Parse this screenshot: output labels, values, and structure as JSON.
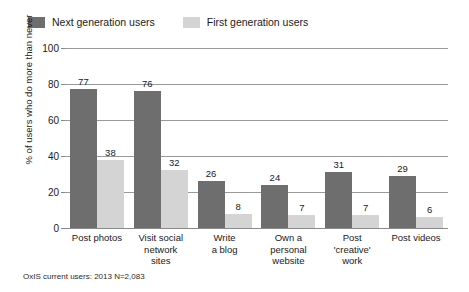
{
  "chart_data": {
    "type": "bar",
    "title": "",
    "xlabel": "",
    "ylabel": "% of users who do more than never",
    "ylim": [
      0,
      100
    ],
    "yticks": [
      0,
      20,
      40,
      60,
      80,
      100
    ],
    "grid": true,
    "legend_position": "top-left",
    "categories": [
      "Post photos",
      "Visit social network sites",
      "Write a blog",
      "Own a personal website",
      "Post 'creative' work",
      "Post videos"
    ],
    "category_lines": [
      [
        "Post photos"
      ],
      [
        "Visit social",
        "network",
        "sites"
      ],
      [
        "Write",
        "a blog"
      ],
      [
        "Own a",
        "personal",
        "website"
      ],
      [
        "Post",
        "'creative'",
        "work"
      ],
      [
        "Post videos"
      ]
    ],
    "series": [
      {
        "name": "Next generation users",
        "color": "#6e6e6e",
        "values": [
          77,
          76,
          26,
          24,
          31,
          29
        ]
      },
      {
        "name": "First generation users",
        "color": "#d4d4d4",
        "values": [
          38,
          32,
          8,
          7,
          7,
          6
        ]
      }
    ],
    "source_note": "OxIS current users: 2013 N=2,083"
  }
}
